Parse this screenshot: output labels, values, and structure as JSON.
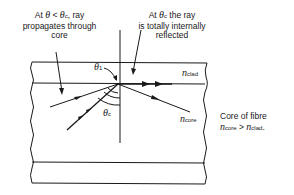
{
  "annotations": {
    "left": {
      "line1_prefix": "At ",
      "theta": "θ",
      "lt": " < ",
      "theta_c": "θ",
      "c_sub": "c",
      "line1_suffix": ", ray",
      "line2": "propagates through",
      "line3": "core"
    },
    "right": {
      "line1_prefix": "At ",
      "theta": "θ",
      "c_sub": "c",
      "line1_suffix": " the ray",
      "line2": "is totally internally",
      "line3": "reflected"
    }
  },
  "labels": {
    "theta_1": "θ",
    "theta_1_sub": "1",
    "theta_c": "θ",
    "theta_c_sub": "c",
    "n_clad": "n",
    "n_clad_sub": "clad",
    "n_core": "n",
    "n_core_sub": "core"
  },
  "side_note": {
    "title": "Core of fibre",
    "n1": "n",
    "n1_sub": "core",
    "gt": " > ",
    "n2": "n",
    "n2_sub": "clad",
    "period": "."
  },
  "colors": {
    "line": "#1a1a1a",
    "background": "#ffffff"
  }
}
